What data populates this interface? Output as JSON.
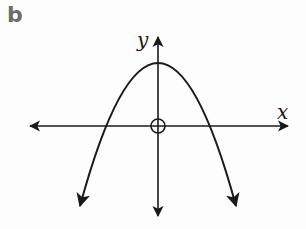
{
  "figure": {
    "part_label": "b",
    "x_axis_label": "x",
    "y_axis_label": "y",
    "colors": {
      "part_label": "#6b6b6b",
      "stroke": "#1a1a1a",
      "background": "#fdfdfd"
    }
  }
}
